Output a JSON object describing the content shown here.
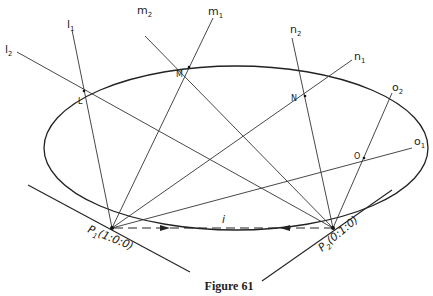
{
  "figure": {
    "caption": "Figure 61",
    "points": {
      "P1": {
        "label": "P",
        "sub": "1",
        "coords": "(1:0:0)"
      },
      "P2": {
        "label": "P",
        "sub": "2",
        "coords": "(0:1:0)"
      },
      "L": "L",
      "M": "M",
      "N": "N",
      "O": "O"
    },
    "lines": {
      "l1": {
        "base": "l",
        "sub": "1"
      },
      "l2": {
        "base": "l",
        "sub": "2"
      },
      "m1": {
        "base": "m",
        "sub": "1"
      },
      "m2": {
        "base": "m",
        "sub": "2"
      },
      "n1": {
        "base": "n",
        "sub": "1"
      },
      "n2": {
        "base": "n",
        "sub": "2"
      },
      "o1": {
        "base": "o",
        "sub": "1"
      },
      "o2": {
        "base": "o",
        "sub": "2"
      },
      "i": "i"
    },
    "colors": {
      "stroke": "#333333",
      "background": "#ffffff"
    }
  }
}
